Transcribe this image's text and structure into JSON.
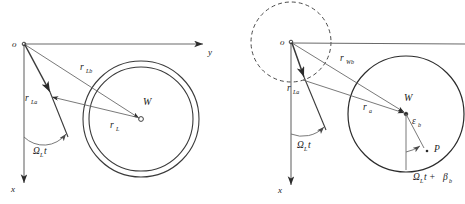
{
  "figure": {
    "title": "",
    "background_color": "#ffffff",
    "line_color": "#4a4a4a",
    "heavy_line_color": "#2b2b2b",
    "text_color": "#1a1a1a"
  },
  "left_diagram": {
    "name": "left-diagram",
    "origin_label": "o",
    "axis_y_label": "y",
    "axis_x_label": "x",
    "center_label": "W",
    "vector_lb_label": "r",
    "vector_lb_sub": "Lb",
    "vector_la_label": "r",
    "vector_la_sub": "La",
    "vector_l_label": "r",
    "vector_l_sub": "L",
    "angle_label": "Ω",
    "angle_sub": "L",
    "angle_suffix": "t",
    "geometry": {
      "origin": [
        24,
        44
      ],
      "y_axis_end": [
        208,
        44
      ],
      "x_axis_end": [
        24,
        188
      ],
      "outer_circle_center": [
        141,
        119
      ],
      "outer_circle_radius": 58,
      "inner_circle_radius": 52,
      "center_marker": [
        141,
        119
      ],
      "la_arrow_tip": [
        50,
        93
      ],
      "lb_arrow_tip": [
        141,
        119
      ],
      "l_arrow_tip": [
        84,
        101
      ],
      "arc_arrow_tip": [
        67,
        137
      ]
    }
  },
  "right_diagram": {
    "name": "right-diagram",
    "origin_label": "o",
    "axis_x_label": "x",
    "center_label": "W",
    "point_label": "P",
    "vector_wb_label": "r",
    "vector_wb_sub": "Wb",
    "vector_la_label": "r",
    "vector_la_sub": "La",
    "vector_a_label": "r",
    "vector_a_sub": "a",
    "epsilon_label": "ε",
    "epsilon_sub": "b",
    "angle_label": "Ω",
    "angle_sub": "L",
    "angle_suffix": "t",
    "beta_expr_omega": "Ω",
    "beta_expr_omega_sub": "L",
    "beta_expr_t_plus": "t +",
    "beta_expr_beta": "β",
    "beta_expr_beta_sub": "b",
    "geometry": {
      "origin": [
        291,
        42
      ],
      "dashed_circle_center": [
        291,
        42
      ],
      "dashed_circle_radius": 40,
      "axis_end_right": [
        465,
        44
      ],
      "x_axis_end": [
        291,
        190
      ],
      "solid_circle_center": [
        406,
        114
      ],
      "solid_circle_radius": 58,
      "center_marker": [
        406,
        114
      ],
      "point_p": [
        427,
        150
      ],
      "la_arrow_tip": [
        303,
        78
      ],
      "wb_arrow_tip": [
        406,
        114
      ],
      "a_arrow_tip": [
        406,
        114
      ],
      "arc_arrow_tip": [
        325,
        130
      ],
      "eps_arc_arrow_tip": [
        418,
        146
      ]
    }
  }
}
